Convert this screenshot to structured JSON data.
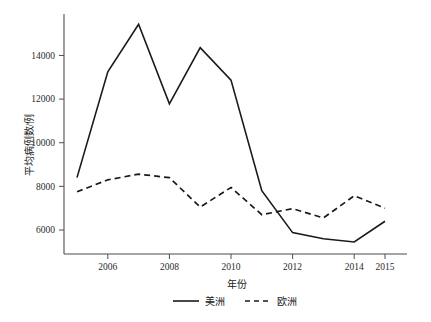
{
  "chart_data": {
    "type": "line",
    "title": "",
    "xlabel": "年份",
    "ylabel": "平均病例数/例",
    "x": [
      2005,
      2006,
      2007,
      2008,
      2009,
      2010,
      2011,
      2012,
      2013,
      2014,
      2015
    ],
    "xlim": [
      2005,
      2015
    ],
    "ylim": [
      4900,
      15900
    ],
    "xticks": [
      2006,
      2008,
      2010,
      2012,
      2014,
      2015
    ],
    "xticklabels": [
      "2006",
      "2008",
      "2010",
      "2012",
      "2014",
      "2015"
    ],
    "yticks": [
      6000,
      8000,
      10000,
      12000,
      14000
    ],
    "yticklabels": [
      "6000",
      "8000",
      "10000",
      "12000",
      "14000"
    ],
    "grid": false,
    "legend_position": "bottom-center",
    "series": [
      {
        "name": "美洲",
        "style": "solid",
        "color": "#1a1a1a",
        "values": [
          8400,
          13250,
          15430,
          11780,
          14360,
          12870,
          7800,
          5880,
          5600,
          5450,
          6400
        ]
      },
      {
        "name": "欧洲",
        "style": "dashed",
        "color": "#1a1a1a",
        "values": [
          7750,
          8300,
          8560,
          8400,
          7050,
          7950,
          6700,
          6980,
          6550,
          7570,
          7000
        ]
      }
    ]
  },
  "legend": {
    "items": [
      {
        "label": "美洲",
        "style": "solid"
      },
      {
        "label": "欧洲",
        "style": "dashed"
      }
    ]
  }
}
